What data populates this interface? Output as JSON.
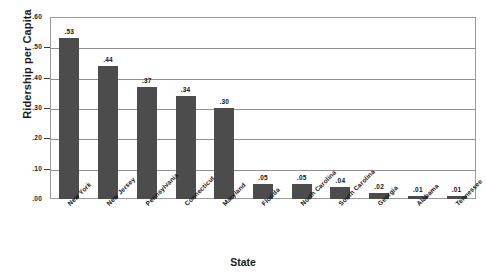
{
  "chart_data": {
    "type": "bar",
    "title": "",
    "xlabel": "State",
    "ylabel": "Ridership per Capita",
    "categories": [
      "New York",
      "New Jersey",
      "Pennsylvania",
      "Connecticut",
      "Maryland",
      "Florida",
      "North Carolina",
      "South Carolina",
      "Georgia",
      "Alabama",
      "Tennessee"
    ],
    "values": [
      0.53,
      0.44,
      0.37,
      0.34,
      0.3,
      0.05,
      0.05,
      0.04,
      0.02,
      0.01,
      0.01
    ],
    "value_labels": [
      ".53",
      ".44",
      ".37",
      ".34",
      ".30",
      ".05",
      ".05",
      ".04",
      ".02",
      ".01",
      ".01"
    ],
    "ylim": [
      0.0,
      0.6
    ],
    "ytick_values": [
      0.0,
      0.1,
      0.2,
      0.3,
      0.4,
      0.5,
      0.6
    ],
    "ytick_labels": [
      ".00",
      ".10",
      ".20",
      ".30",
      ".40",
      ".50",
      ".60"
    ],
    "grid": true,
    "grid_axis": "y",
    "legend": false,
    "bar_color": "#4c4c4c",
    "frame_color": "#9a9a9a",
    "gridline_color": "#8f8f8f",
    "background_color": "#ffffff",
    "xtick_label_rotation": -45
  },
  "axes": {
    "y_title": "Ridership per Capita",
    "x_title": "State"
  }
}
